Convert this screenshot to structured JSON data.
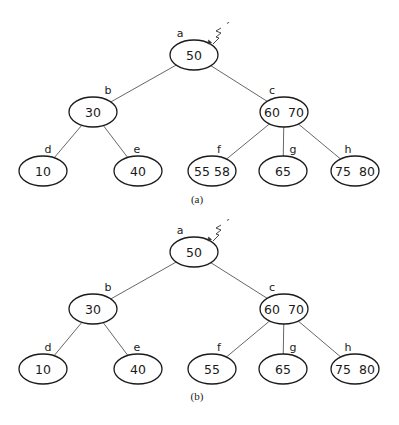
{
  "panels": [
    {
      "caption": "(a)",
      "offset_y": 0,
      "pointer": {
        "node": "a",
        "mark": "′"
      },
      "nodes": [
        {
          "id": "a",
          "label": "a",
          "keys": "50",
          "cx": 194,
          "cy": 55
        },
        {
          "id": "b",
          "label": "b",
          "keys": "30",
          "cx": 93,
          "cy": 112
        },
        {
          "id": "c",
          "label": "c",
          "keys": "60  70",
          "cx": 284,
          "cy": 112
        },
        {
          "id": "d",
          "label": "d",
          "keys": "10",
          "cx": 43,
          "cy": 171
        },
        {
          "id": "e",
          "label": "e",
          "keys": "40",
          "cx": 138,
          "cy": 171
        },
        {
          "id": "f",
          "label": "f",
          "keys": "55 58",
          "cx": 212,
          "cy": 171
        },
        {
          "id": "g",
          "label": "g",
          "keys": "65",
          "cx": 283,
          "cy": 171
        },
        {
          "id": "h",
          "label": "h",
          "keys": "75  80",
          "cx": 355,
          "cy": 171
        }
      ],
      "edges": [
        [
          "a",
          "b"
        ],
        [
          "a",
          "c"
        ],
        [
          "b",
          "d"
        ],
        [
          "b",
          "e"
        ],
        [
          "c",
          "f"
        ],
        [
          "c",
          "g"
        ],
        [
          "c",
          "h"
        ]
      ]
    },
    {
      "caption": "(b)",
      "offset_y": 0,
      "pointer": {
        "node": "a",
        "mark": "′"
      },
      "nodes": [
        {
          "id": "a",
          "label": "a",
          "keys": "50",
          "cx": 194,
          "cy": 252
        },
        {
          "id": "b",
          "label": "b",
          "keys": "30",
          "cx": 93,
          "cy": 309
        },
        {
          "id": "c",
          "label": "c",
          "keys": "60  70",
          "cx": 284,
          "cy": 309
        },
        {
          "id": "d",
          "label": "d",
          "keys": "10",
          "cx": 43,
          "cy": 369
        },
        {
          "id": "e",
          "label": "e",
          "keys": "40",
          "cx": 138,
          "cy": 369
        },
        {
          "id": "f",
          "label": "f",
          "keys": "55",
          "cx": 212,
          "cy": 369
        },
        {
          "id": "g",
          "label": "g",
          "keys": "65",
          "cx": 283,
          "cy": 369
        },
        {
          "id": "h",
          "label": "h",
          "keys": "75  80",
          "cx": 355,
          "cy": 369
        }
      ],
      "edges": [
        [
          "a",
          "b"
        ],
        [
          "a",
          "c"
        ],
        [
          "b",
          "d"
        ],
        [
          "b",
          "e"
        ],
        [
          "c",
          "f"
        ],
        [
          "c",
          "g"
        ],
        [
          "c",
          "h"
        ]
      ]
    }
  ],
  "captions": {
    "a": "(a)",
    "b": "(b)"
  },
  "style": {
    "node_rx": 24,
    "node_ry": 15,
    "stroke": "#1a1a1a",
    "edge": "#555555"
  }
}
